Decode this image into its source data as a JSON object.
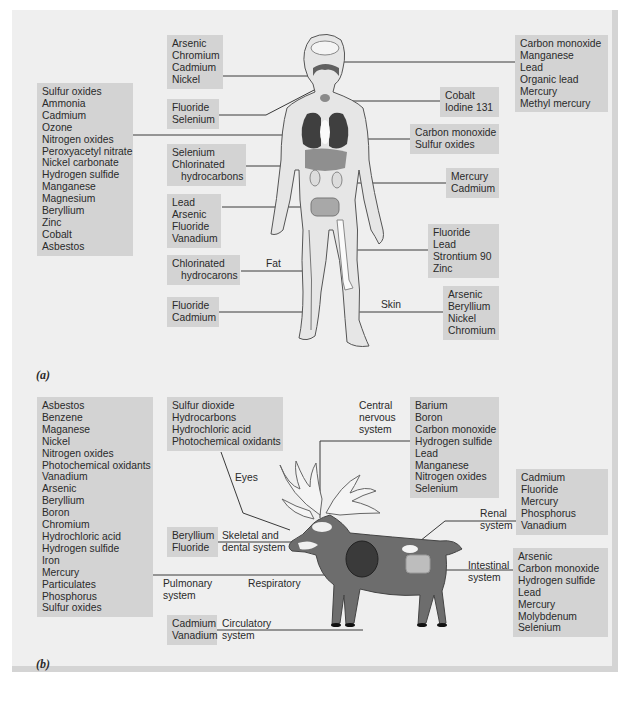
{
  "panel_a": {
    "label": "(a)",
    "boxes": {
      "mouth": [
        "Arsenic",
        "Chromium",
        "Cadmium",
        "Nickel"
      ],
      "teeth": [
        "Fluoride",
        "Selenium"
      ],
      "lungs_left": [
        "Sulfur oxides",
        "Ammonia",
        "Cadmium",
        "Ozone",
        "Nitrogen oxides",
        "Peroxyacetyl nitrate",
        "Nickel carbonate",
        "Hydrogen sulfide",
        "Manganese",
        "Magnesium",
        "Beryllium",
        "Zinc",
        "Cobalt",
        "Asbestos"
      ],
      "liver": [
        "Selenium",
        "Chlorinated",
        "hydrocarbons"
      ],
      "intestine": [
        "Lead",
        "Arsenic",
        "Fluoride",
        "Vanadium"
      ],
      "fat": [
        "Chlorinated",
        "hydrocarons"
      ],
      "blood": [
        "Fluoride",
        "Cadmium"
      ],
      "brain": [
        "Carbon monoxide",
        "Manganese",
        "Lead",
        "Organic lead",
        "Mercury",
        "Methyl mercury"
      ],
      "thyroid": [
        "Cobalt",
        "Iodine 131"
      ],
      "lungs_right": [
        "Carbon monoxide",
        "Sulfur oxides"
      ],
      "kidney": [
        "Mercury",
        "Cadmium"
      ],
      "bone": [
        "Fluoride",
        "Lead",
        "Strontium 90",
        "Zinc"
      ],
      "skin": [
        "Arsenic",
        "Beryllium",
        "Nickel",
        "Chromium"
      ]
    },
    "tissue_labels": {
      "fat": "Fat",
      "skin": "Skin"
    }
  },
  "panel_b": {
    "label": "(b)",
    "boxes": {
      "pulmonary": [
        "Asbestos",
        "Benzene",
        "Maganese",
        "Nickel",
        "Nitrogen oxides",
        "Photochemical oxidants",
        "Vanadium",
        "Arsenic",
        "Beryllium",
        "Boron",
        "Chromium",
        "Hydrochloric acid",
        "Hydrogen sulfide",
        "Iron",
        "Mercury",
        "Particulates",
        "Phosphorus",
        "Sulfur oxides"
      ],
      "eyes": [
        "Sulfur dioxide",
        "Hydrocarbons",
        "Hydrochloric acid",
        "Photochemical oxidants"
      ],
      "cns": [
        "Barium",
        "Boron",
        "Carbon monoxide",
        "Hydrogen sulfide",
        "Lead",
        "Manganese",
        "Nitrogen oxides",
        "Selenium"
      ],
      "renal": [
        "Cadmium",
        "Fluoride",
        "Mercury",
        "Phosphorus",
        "Vanadium"
      ],
      "skeletal": [
        "Beryllium",
        "Fluoride"
      ],
      "intestinal": [
        "Arsenic",
        "Carbon monoxide",
        "Hydrogen sulfide",
        "Lead",
        "Mercury",
        "Molybdenum",
        "Selenium"
      ],
      "circulatory": [
        "Cadmium",
        "Vanadium"
      ]
    },
    "system_labels": {
      "eyes": "Eyes",
      "cns": [
        "Central",
        "nervous",
        "system"
      ],
      "renal": [
        "Renal",
        "system"
      ],
      "skeletal": [
        "Skeletal and",
        "dental system"
      ],
      "intestinal": [
        "Intestinal",
        "system"
      ],
      "pulmonary": [
        "Pulmonary",
        "system"
      ],
      "respiratory": "Respiratory",
      "circulatory": [
        "Circulatory",
        "system"
      ]
    }
  },
  "colors": {
    "frame_bg": "#efefef",
    "box_bg": "#d3d3d3",
    "line": "#3a3a3a",
    "organ_dark": "#4a4a4a",
    "body_fill": "#e4e4e4",
    "reindeer_fill": "#6d6d6d"
  }
}
